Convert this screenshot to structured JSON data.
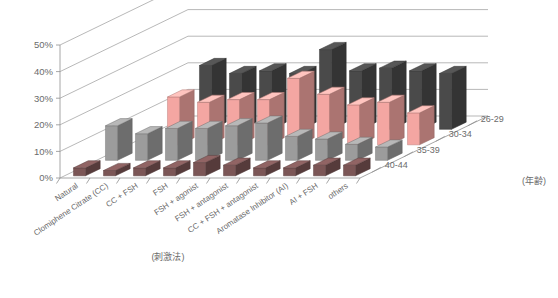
{
  "chart_data": {
    "type": "bar",
    "title": "",
    "subtitle": "",
    "xlabel": "(刺激法)",
    "ylabel": "",
    "legend_title": "(年齢)",
    "legend_position": "right",
    "grid": true,
    "projection": "3d",
    "ylim": [
      0,
      50
    ],
    "ytick_labels": [
      "0%",
      "10%",
      "20%",
      "30%",
      "40%",
      "50%"
    ],
    "ytick_values": [
      0,
      10,
      20,
      30,
      40,
      50
    ],
    "categories": [
      "Natural",
      "Clomiphene Citrate (CC)",
      "CC + FSH",
      "FSH",
      "FSH + agonist",
      "FSH + antagonist",
      "CC + FSH + antagonist",
      "Aromatase Inhibitor (AI)",
      "AI + FSH",
      "others"
    ],
    "series": [
      {
        "name": "26-29",
        "color": "#4a4a4a",
        "values": [
          0,
          24,
          21,
          22,
          21,
          30,
          22,
          23,
          22,
          21
        ]
      },
      {
        "name": "30-34",
        "color": "#f4a6a2",
        "values": [
          0,
          18,
          16,
          17,
          17,
          25,
          19,
          15,
          16,
          12
        ]
      },
      {
        "name": "35-39",
        "color": "#9c9c9c",
        "values": [
          13,
          10,
          12,
          12,
          13,
          14,
          9,
          8,
          6,
          5
        ]
      },
      {
        "name": "40-44",
        "color": "#7b5555",
        "values": [
          3,
          2,
          3,
          3,
          5,
          4,
          3,
          3,
          4,
          4
        ]
      }
    ]
  }
}
